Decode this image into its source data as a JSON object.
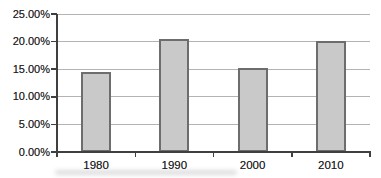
{
  "chart_data": {
    "type": "bar",
    "title": "",
    "xlabel": "",
    "ylabel": "",
    "categories": [
      "1980",
      "1990",
      "2000",
      "2010"
    ],
    "values": [
      14.5,
      20.5,
      15.3,
      20.1
    ],
    "ylim": [
      0,
      25
    ],
    "ytick_step": 5,
    "ytick_labels": [
      "0.00%",
      "5.00%",
      "10.00%",
      "15.00%",
      "20.00%",
      "25.00%"
    ],
    "grid": true,
    "legend_position": "none",
    "colors": {
      "bar_fill": "#c9c9c9",
      "bar_border": "#6d6d6d",
      "gridline": "#b3b3b3",
      "axis": "#3f3f3f",
      "text": "#1e1e1e",
      "background": "#ffffff"
    }
  }
}
